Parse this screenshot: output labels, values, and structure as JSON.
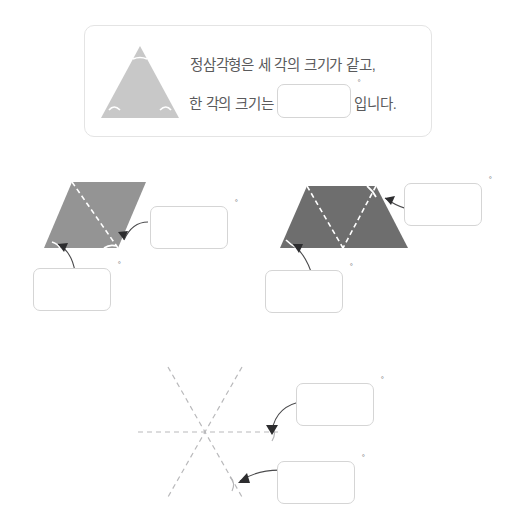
{
  "page": {
    "background_color": "#ffffff"
  },
  "statement": {
    "line1": "정삼각형은 세 각의 크기가 같고,",
    "line2_prefix": "한 각의 크기는",
    "line2_suffix": "입니다.",
    "answer_value": "",
    "degree_symbol": "°",
    "figure_icon": "equilateral-triangle-icon",
    "figure_fill": "#c8c8c8"
  },
  "figures": [
    {
      "id": "parallelogram",
      "name": "parallelogram-figure",
      "fill": "#949494",
      "dashed_diagonal": true,
      "answers": [
        {
          "id": "parallelogram-angle-right",
          "value": "",
          "degree_symbol": "°"
        },
        {
          "id": "parallelogram-angle-left",
          "value": "",
          "degree_symbol": "°"
        }
      ]
    },
    {
      "id": "trapezoid",
      "name": "trapezoid-figure",
      "fill": "#6e6e6e",
      "dashed_diagonal": true,
      "answers": [
        {
          "id": "trapezoid-angle-top-right",
          "value": "",
          "degree_symbol": "°"
        },
        {
          "id": "trapezoid-angle-bottom-left",
          "value": "",
          "degree_symbol": "°"
        }
      ]
    },
    {
      "id": "dashed-star",
      "name": "intersecting-lines-figure",
      "line_color": "#b9b9bb",
      "line_count": 3,
      "answers": [
        {
          "id": "star-angle-upper",
          "value": "",
          "degree_symbol": "°"
        },
        {
          "id": "star-angle-lower",
          "value": "",
          "degree_symbol": "°"
        }
      ]
    }
  ]
}
